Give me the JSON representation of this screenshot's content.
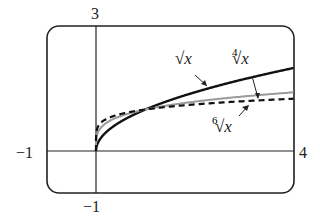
{
  "chart_data": {
    "type": "line",
    "title": "",
    "xlabel": "",
    "ylabel": "",
    "xlim": [
      -1,
      4
    ],
    "ylim": [
      -1,
      3
    ],
    "grid": false,
    "series": [
      {
        "name": "√x",
        "style": "solid-thick",
        "x": [
          0,
          0.25,
          0.5,
          1,
          2,
          3,
          4
        ],
        "values": [
          0,
          0.5,
          0.707,
          1,
          1.414,
          1.732,
          2
        ]
      },
      {
        "name": "⁴√x",
        "style": "solid-gray",
        "x": [
          0,
          0.25,
          0.5,
          1,
          2,
          3,
          4
        ],
        "values": [
          0,
          0.707,
          0.841,
          1,
          1.189,
          1.316,
          1.414
        ]
      },
      {
        "name": "⁶√x",
        "style": "dashed",
        "x": [
          0,
          0.25,
          0.5,
          1,
          2,
          3,
          4
        ],
        "values": [
          0,
          0.794,
          0.891,
          1,
          1.122,
          1.201,
          1.26
        ]
      }
    ],
    "annotations": [
      "√x",
      "⁴√x",
      "⁶√x"
    ]
  },
  "axes": {
    "y_top_label": "3",
    "y_bottom_label": "−1",
    "x_left_label": "−1",
    "x_right_label": "4"
  },
  "labels": {
    "sqrt": "√x",
    "root4_index": "4",
    "root6_index": "6",
    "radical": "√x"
  }
}
